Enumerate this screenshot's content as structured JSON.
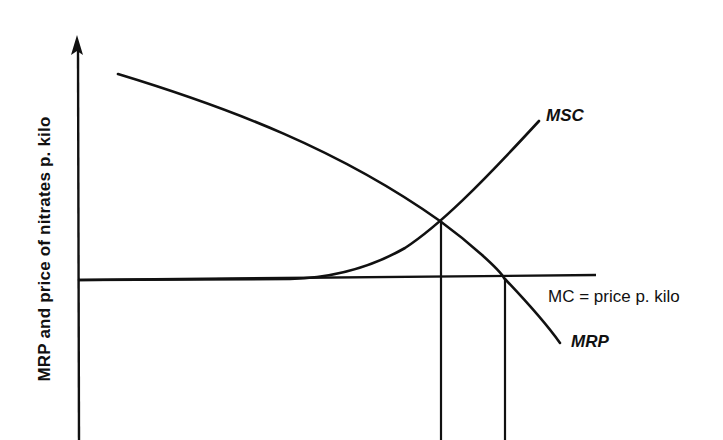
{
  "diagram": {
    "y_axis_label": "MRP and price of nitrates p. kilo",
    "curves": [
      {
        "name": "MRP",
        "label": "MRP",
        "description": "Marginal revenue product, downward sloping concave"
      },
      {
        "name": "MSC",
        "label": "MSC",
        "description": "Marginal social cost, flat along MC then rising"
      },
      {
        "name": "MC",
        "label": "MC = price p. kilo",
        "description": "Horizontal private marginal cost line"
      }
    ],
    "intersections": [
      {
        "between": [
          "MRP",
          "MSC"
        ],
        "note": "social optimum, dropped to x-axis"
      },
      {
        "between": [
          "MRP",
          "MC"
        ],
        "note": "private optimum, dropped to x-axis"
      }
    ],
    "colors": {
      "line": "#111111",
      "background": "#ffffff"
    }
  }
}
